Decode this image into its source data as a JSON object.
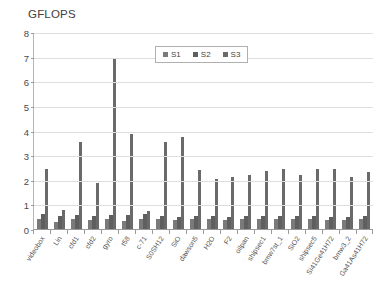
{
  "chart_data": {
    "type": "bar",
    "title": "GFLOPS",
    "xlabel": "",
    "ylabel": "",
    "ylim": [
      0,
      8
    ],
    "yticks": [
      0,
      1,
      2,
      3,
      4,
      5,
      6,
      7,
      8
    ],
    "grid": true,
    "legend_position": "top-center-inside",
    "categories": [
      "videobox",
      "Lin",
      "cfd1",
      "cfd2",
      "gyro",
      "t58",
      "c-71",
      "S0SH12",
      "SiO",
      "dawson5",
      "H2O",
      "F2",
      "oilpan",
      "shipsec1",
      "bmw7st_1",
      "SiO2",
      "shipsec5",
      "Si41Ge41H72",
      "bmw3_2",
      "Ga41As41H72"
    ],
    "series": [
      {
        "name": "S1",
        "color": "#7a7a7a",
        "values": [
          0.42,
          0.3,
          0.42,
          0.38,
          0.4,
          0.32,
          0.42,
          0.4,
          0.38,
          0.4,
          0.4,
          0.36,
          0.4,
          0.42,
          0.4,
          0.4,
          0.4,
          0.38,
          0.38,
          0.4
        ]
      },
      {
        "name": "S2",
        "color": "#5f5f5f",
        "values": [
          0.62,
          0.52,
          0.58,
          0.52,
          0.55,
          0.58,
          0.6,
          0.52,
          0.5,
          0.52,
          0.52,
          0.5,
          0.52,
          0.52,
          0.52,
          0.52,
          0.52,
          0.5,
          0.5,
          0.52
        ]
      },
      {
        "name": "S3",
        "color": "#6a6a6a",
        "values": [
          2.45,
          0.78,
          3.55,
          1.85,
          6.95,
          3.85,
          0.72,
          3.55,
          3.75,
          2.4,
          2.05,
          2.1,
          2.2,
          2.35,
          2.45,
          2.2,
          2.45,
          2.45,
          2.1,
          2.3
        ]
      }
    ]
  },
  "legend": {
    "items": [
      {
        "label": "S1"
      },
      {
        "label": "S2"
      },
      {
        "label": "S3"
      }
    ]
  }
}
